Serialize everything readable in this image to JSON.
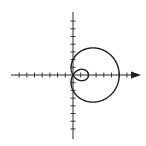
{
  "chart_data": {
    "type": "line",
    "subtype": "polar",
    "title": "",
    "equation": "r = 2 + 4cos(theta)",
    "curve_name": "limacon with inner loop",
    "params": {
      "a": 2,
      "b": 4
    },
    "theta_range": [
      0,
      6.283185
    ],
    "xlabel": "",
    "ylabel": "",
    "xlim": [
      -8,
      8.8
    ],
    "ylim": [
      -8.3,
      8.2
    ],
    "grid": false,
    "legend": null,
    "x_axis_arrow": true,
    "tick_spacing": 1,
    "key_points": [
      {
        "label": "outer loop max x",
        "x": 6,
        "y": 0
      },
      {
        "label": "inner loop max x",
        "x": 2,
        "y": 0
      },
      {
        "label": "y-intercept top",
        "x": 0,
        "y": 2
      },
      {
        "label": "y-intercept bottom",
        "x": 0,
        "y": -2
      },
      {
        "label": "pole",
        "x": 0,
        "y": 0
      }
    ],
    "colors": {
      "curve": "#1e1e1e",
      "axes": "#2a2a2a"
    }
  },
  "layout": {
    "origin_px": [
      73,
      75
    ],
    "scale_px_per_unit": 7.7,
    "x_axis_left_px": 11,
    "x_axis_right_px": 133,
    "arrow_tip_px": 141,
    "y_axis_top_px": 12,
    "y_axis_bottom_px": 139
  }
}
